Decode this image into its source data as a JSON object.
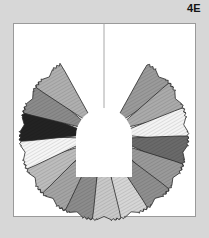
{
  "figure": {
    "label": "4E",
    "caption": "Radial fan rosette composed of hatched pinked-edge petal wedges on a bisected white plate",
    "background_color": "#d7d7d7"
  },
  "plate": {
    "name": "plate-frame",
    "x": 13,
    "y": 23,
    "width": 183,
    "height": 194,
    "fill": "#ffffff",
    "border_color": "#9a9a9a",
    "centerline_color": "#a8a8a8",
    "centerline_x": 104
  },
  "rosette": {
    "center_x": 104,
    "center_y": 136,
    "inner_radius": 27,
    "outer_radius": 84,
    "petal_count": 14,
    "gap_bottom_degrees": 66,
    "hole_fill": "#ffffff",
    "outline_color": "#2a2a2a",
    "hatch_color": "#6b6b6b",
    "petals": [
      {
        "index": 1,
        "name": "petal-lower-left-1",
        "fill": "#9b9b9b",
        "angle_deg": 123
      },
      {
        "index": 2,
        "name": "petal-left-2",
        "fill": "#ababab",
        "angle_deg": 146
      },
      {
        "index": 3,
        "name": "petal-left-3",
        "fill": "#f4f4f4",
        "angle_deg": 169
      },
      {
        "index": 4,
        "name": "petal-upper-left-4",
        "fill": "#6a6a6a",
        "angle_deg": 192
      },
      {
        "index": 5,
        "name": "petal-upper-left-5",
        "fill": "#9a9a9a",
        "angle_deg": 215
      },
      {
        "index": 6,
        "name": "petal-upper-left-6",
        "fill": "#8f8f8f",
        "angle_deg": 238
      },
      {
        "index": 7,
        "name": "petal-top-left-7",
        "fill": "#d6d6d6",
        "angle_deg": 259
      },
      {
        "index": 8,
        "name": "petal-top-right-8",
        "fill": "#c9c9c9",
        "angle_deg": 281
      },
      {
        "index": 9,
        "name": "petal-upper-right-9",
        "fill": "#8c8c8c",
        "angle_deg": 303
      },
      {
        "index": 10,
        "name": "petal-upper-right-10",
        "fill": "#a4a4a4",
        "angle_deg": 325
      },
      {
        "index": 11,
        "name": "petal-right-11",
        "fill": "#bdbdbd",
        "angle_deg": 347
      },
      {
        "index": 12,
        "name": "petal-right-12",
        "fill": "#f6f6f6",
        "angle_deg": 9
      },
      {
        "index": 13,
        "name": "petal-right-13",
        "fill": "#232323",
        "angle_deg": 31
      },
      {
        "index": 14,
        "name": "petal-lower-right-14",
        "fill": "#8b8b8b",
        "angle_deg": 53
      },
      {
        "index": 15,
        "name": "petal-lower-right-15",
        "fill": "#b0b0b0",
        "angle_deg": 75
      }
    ]
  }
}
